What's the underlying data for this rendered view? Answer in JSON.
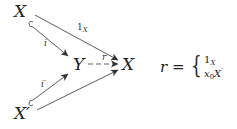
{
  "diagram": {
    "type": "commutative-diagram",
    "nodes": {
      "x_top": {
        "label": "X"
      },
      "x_bottom": {
        "label": "X",
        "prime": "′"
      },
      "y_mid": {
        "label": "Y"
      },
      "x_right": {
        "label": "X"
      }
    },
    "edges": [
      {
        "from": "x_top",
        "to": "x_right",
        "label": "1",
        "label_sub": "X",
        "style": "solid"
      },
      {
        "from": "x_top",
        "to": "y_mid",
        "label": "i",
        "style": "hook-inclusion"
      },
      {
        "from": "x_bottom",
        "to": "y_mid",
        "label": "i′",
        "style": "hook-inclusion"
      },
      {
        "from": "x_bottom",
        "to": "x_right",
        "label": "",
        "style": "solid"
      },
      {
        "from": "y_mid",
        "to": "x_right",
        "label": "r",
        "style": "dashed"
      }
    ]
  },
  "formula": {
    "lhs": "r =",
    "brace": "{",
    "case1_main": "1",
    "case1_sub": "X",
    "case2_main": "x",
    "case2_sub": "0",
    "case2_tail": "X",
    "case2_prime": "′"
  },
  "colors": {
    "stroke": "#333333",
    "text": "#222222",
    "background": "#ffffff"
  }
}
